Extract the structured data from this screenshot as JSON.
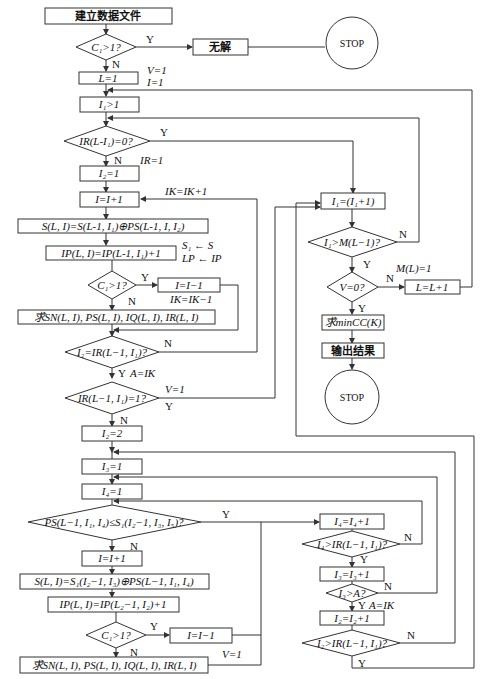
{
  "flowchart": {
    "start": "建立数据文件",
    "d_c1_top": "C₁>1?",
    "no_solution": "无解",
    "stop1": "STOP",
    "init_L": "L=1",
    "init_V": "V=1",
    "init_I": "I=1",
    "set_I1": "I₁>1",
    "d_ir": "IR(L-I₁)=0?",
    "ir_set": "IR=1",
    "set_I2": "I₂=1",
    "inc_I": "I=I+1",
    "ik_inc": "IK=IK+1",
    "calc_S": "S(L, I)=S(L-1, I₁)⊕PS(L-1, I, I₂)",
    "assign_S": "S₁ ← S",
    "assign_LP": "LP ← IP",
    "calc_IP": "IP(L, I)=IP(L-1, I₁)+1",
    "d_c1_mid": "C₁>1?",
    "dec_I": "I=I−1",
    "ik_dec": "IK=IK−1",
    "calc_SN": "求SN(L, I), PS(L, I), IQ(L, I), IR(L, I)",
    "d_i2": "I₂=IR(L−1, I₁)?",
    "a_ik": "A=IK",
    "d_ir1": "IR(L−1, I₁)=1?",
    "v1": "V=1",
    "set_I2_2": "I₂=2",
    "set_I3": "I₃=1",
    "set_I4": "I₄=1",
    "d_ps": "PS(L−1, I₁, I₄)≤S₁(I₂−1, I₃, I₅)?",
    "inc_I_2": "I=I+1",
    "calc_S2": "S(L, I)=S₁(I₂−1, I₃)⊕PS(L−1, I₁, I₄)",
    "calc_IP2": "IP(L, I)=IP(L₂−1, I₂)+1",
    "d_c1_bot": "C₁>1?",
    "dec_I_2": "I=I−1",
    "calc_SN2": "求SN(L, I), PS(L, I), IQ(L, I), IR(L, I)",
    "v1_bot": "V=1",
    "inc_I1": "I₁=(I₁+1)",
    "d_i1m": "I₁>M(L−1)?",
    "d_v0": "V=0?",
    "m_l": "M(L)=1",
    "inc_L": "L=L+1",
    "min_cc": "求minCC(K)",
    "output": "输出结果",
    "stop2": "STOP",
    "inc_I4": "I₄=I₄+1",
    "d_i4": "I₄>IR(L−1, I₁)?",
    "inc_I3": "I₃=I₃+1",
    "d_i3": "I₃>A?",
    "a_ik2": "A=IK",
    "inc_I2": "I₂=I₂+1",
    "d_i2b": "I₂>IR(L−1, I₁)?",
    "yes": "Y",
    "no": "N"
  }
}
